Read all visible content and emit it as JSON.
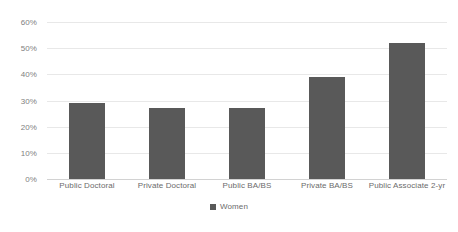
{
  "chart_data": {
    "type": "bar",
    "title": "",
    "xlabel": "",
    "ylabel": "",
    "categories": [
      "Public Doctoral",
      "Private Doctoral",
      "Public BA/BS",
      "Private BA/BS",
      "Public Associate 2-yr"
    ],
    "series": [
      {
        "name": "Women",
        "color": "#595959",
        "values": [
          29,
          27,
          27,
          39,
          52
        ]
      }
    ],
    "ylim": [
      0,
      60
    ],
    "ytick_values": [
      0,
      10,
      20,
      30,
      40,
      50,
      60
    ],
    "ytick_labels": [
      "0%",
      "10%",
      "20%",
      "30%",
      "40%",
      "50%",
      "60%"
    ],
    "grid": true,
    "grid_axis": "y",
    "legend": {
      "position": "bottom-center",
      "entries": [
        {
          "label": "Women",
          "color": "#595959",
          "marker": "square-swatch"
        }
      ]
    },
    "value_format": "percent"
  },
  "colors": {
    "bar": "#595959",
    "gridline": "#e8e8e8",
    "baseline": "#d2d2d2",
    "tick_text": "#808080",
    "category_text": "#6b6b6b",
    "background": "#ffffff"
  }
}
